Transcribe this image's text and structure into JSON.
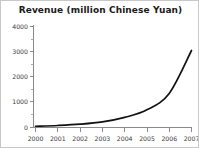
{
  "chart_data": {
    "type": "line",
    "title": "Revenue (million Chinese Yuan)",
    "xlabel": "",
    "ylabel": "",
    "x": [
      2000,
      2001,
      2002,
      2003,
      2004,
      2005,
      2006,
      2007
    ],
    "values": [
      50,
      80,
      130,
      220,
      400,
      700,
      1350,
      3050
    ],
    "series": [
      {
        "name": "Revenue",
        "values": [
          50,
          80,
          130,
          220,
          400,
          700,
          1350,
          3050
        ]
      }
    ],
    "categories": [
      "2000",
      "2001",
      "2002",
      "2003",
      "2004",
      "2005",
      "2006",
      "2007"
    ],
    "xlim": [
      2000,
      2007
    ],
    "ylim": [
      0,
      4000
    ],
    "x_tick_labels": [
      "2000",
      "2001",
      "2002",
      "2003",
      "2004",
      "2005",
      "2006",
      "2007"
    ],
    "y_tick_labels": [
      "0",
      "1000",
      "2000",
      "3000",
      "4000"
    ],
    "y_ticks": [
      0,
      1000,
      2000,
      3000,
      4000
    ],
    "y_minor_ticks": [
      500,
      1500,
      2500,
      3500
    ],
    "grid": false,
    "legend": false,
    "line_color": "#111111",
    "axis_color": "#8a8a8a",
    "title_color": "#1a1a1a",
    "background": "#ffffff",
    "border_color": "#c8c8c8"
  }
}
